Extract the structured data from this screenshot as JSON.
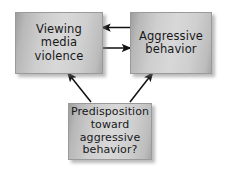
{
  "diagram": {
    "background_color": "#ffffff",
    "box_fill_light": "#d8d8d8",
    "box_fill_dark": "#9e9e9e",
    "box_border_color": "#9a9a9a",
    "text_color": "#17181a",
    "arrow_color": "#101010",
    "nodes": [
      {
        "id": "viewing-media-violence",
        "label": "Viewing\nmedia\nviolence",
        "lines": [
          "Viewing",
          "media",
          "violence"
        ]
      },
      {
        "id": "aggressive-behavior",
        "label": "Aggressive\nbehavior",
        "lines": [
          "Aggressive",
          "behavior"
        ]
      },
      {
        "id": "predisposition",
        "label": "Predisposition\ntoward\naggressive\nbehavior?",
        "lines": [
          "Predisposition",
          "toward",
          "aggressive",
          "behavior?"
        ]
      }
    ],
    "arrows": [
      {
        "id": "aggressive-to-viewing",
        "from": "aggressive-behavior",
        "to": "viewing-media-violence",
        "direction": "left",
        "style": "straight-horizontal"
      },
      {
        "id": "viewing-to-aggressive",
        "from": "viewing-media-violence",
        "to": "aggressive-behavior",
        "direction": "right",
        "style": "straight-horizontal"
      },
      {
        "id": "predisposition-to-viewing",
        "from": "predisposition",
        "to": "viewing-media-violence",
        "direction": "up-left",
        "style": "diagonal"
      },
      {
        "id": "predisposition-to-aggressive",
        "from": "predisposition",
        "to": "aggressive-behavior",
        "direction": "up-right",
        "style": "diagonal"
      }
    ]
  }
}
